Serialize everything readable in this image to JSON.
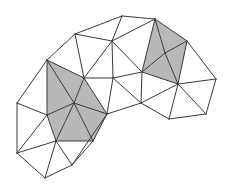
{
  "diagram": {
    "type": "triangulated-mesh",
    "background": "#ffffff",
    "stroke_color": "#3a3a3a",
    "fill_highlight": "#b8b8b8",
    "vertices": {
      "a": [
        75,
        34
      ],
      "b": [
        122,
        16
      ],
      "c": [
        155,
        19
      ],
      "d": [
        112,
        41
      ],
      "e": [
        47,
        60
      ],
      "f": [
        84,
        78
      ],
      "g": [
        113,
        78
      ],
      "h": [
        142,
        72
      ],
      "i": [
        165,
        53
      ],
      "j": [
        187,
        41
      ],
      "k": [
        178,
        84
      ],
      "l": [
        74,
        103
      ],
      "m": [
        107,
        114
      ],
      "n": [
        47,
        115
      ],
      "o": [
        56,
        141
      ],
      "p": [
        93,
        141
      ],
      "q": [
        17,
        103
      ],
      "r": [
        17,
        153
      ],
      "s": [
        45,
        178
      ],
      "t": [
        72,
        165
      ],
      "u": [
        141,
        103
      ],
      "v": [
        169,
        119
      ],
      "w": [
        206,
        114
      ],
      "x": [
        216,
        79
      ]
    },
    "shaded_triangles": [
      [
        "e",
        "f",
        "l"
      ],
      [
        "e",
        "l",
        "n"
      ],
      [
        "f",
        "m",
        "l"
      ],
      [
        "n",
        "l",
        "o"
      ],
      [
        "l",
        "p",
        "o"
      ],
      [
        "l",
        "m",
        "p"
      ],
      [
        "c",
        "j",
        "i"
      ],
      [
        "c",
        "i",
        "h"
      ],
      [
        "h",
        "i",
        "k"
      ],
      [
        "i",
        "j",
        "k"
      ]
    ],
    "triangles": [
      [
        "a",
        "b",
        "d"
      ],
      [
        "b",
        "c",
        "d"
      ],
      [
        "a",
        "d",
        "f"
      ],
      [
        "a",
        "f",
        "e"
      ],
      [
        "d",
        "g",
        "f"
      ],
      [
        "d",
        "c",
        "h"
      ],
      [
        "d",
        "h",
        "g"
      ],
      [
        "f",
        "g",
        "m"
      ],
      [
        "g",
        "h",
        "u"
      ],
      [
        "g",
        "u",
        "m"
      ],
      [
        "h",
        "k",
        "u"
      ],
      [
        "u",
        "k",
        "v"
      ],
      [
        "k",
        "w",
        "v"
      ],
      [
        "k",
        "x",
        "w"
      ],
      [
        "j",
        "x",
        "k"
      ],
      [
        "e",
        "n",
        "q"
      ],
      [
        "q",
        "n",
        "r"
      ],
      [
        "n",
        "o",
        "r"
      ],
      [
        "r",
        "o",
        "s"
      ],
      [
        "o",
        "t",
        "s"
      ],
      [
        "o",
        "p",
        "t"
      ],
      [
        "p",
        "m",
        "t"
      ]
    ]
  }
}
